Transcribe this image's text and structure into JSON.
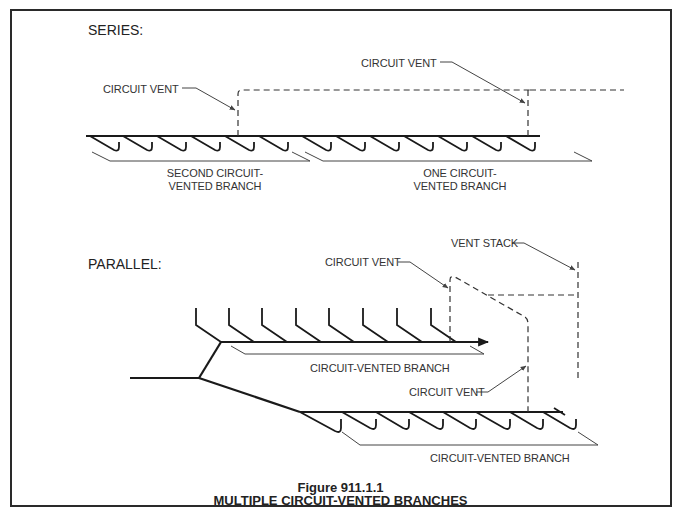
{
  "figure": {
    "number": "Figure 911.1.1",
    "title": "MULTIPLE CIRCUIT-VENTED BRANCHES"
  },
  "series": {
    "heading": "SERIES:",
    "labels": {
      "circuit_vent_left": "CIRCUIT VENT",
      "circuit_vent_right": "CIRCUIT VENT",
      "second_branch_line1": "SECOND CIRCUIT-",
      "second_branch_line2": "VENTED BRANCH",
      "one_branch_line1": "ONE CIRCUIT-",
      "one_branch_line2": "VENTED BRANCH"
    },
    "fixture_count_second_branch": 6,
    "fixture_count_one_branch": 7
  },
  "parallel": {
    "heading": "PARALLEL:",
    "labels": {
      "circuit_vent_upper": "CIRCUIT VENT",
      "vent_stack": "VENT STACK",
      "upper_branch": "CIRCUIT-VENTED BRANCH",
      "circuit_vent_lower": "CIRCUIT VENT",
      "lower_branch": "CIRCUIT-VENTED BRANCH"
    },
    "fixture_count_upper_branch": 8,
    "fixture_count_lower_branch": 8
  },
  "colors": {
    "pipe": "#1a1a1a",
    "vent": "#333333",
    "leader": "#444444",
    "frame": "#2a2a2a"
  }
}
